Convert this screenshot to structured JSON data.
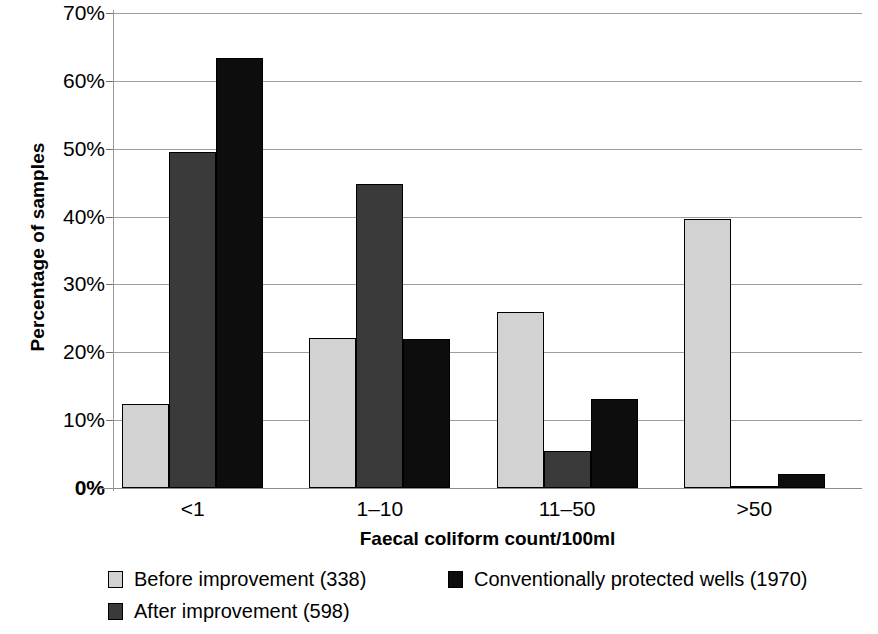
{
  "chart_data": {
    "type": "bar",
    "title": "",
    "xlabel": "Faecal coliform count/100ml",
    "ylabel": "Percentage of samples",
    "categories": [
      "<1",
      "1–10",
      "11–50",
      ">50"
    ],
    "series": [
      {
        "name": "Before improvement (338)",
        "color": "#d2d2d2",
        "values": [
          12.4,
          22.1,
          26.0,
          39.6
        ]
      },
      {
        "name": "After improvement (598)",
        "color": "#3a3a3a",
        "values": [
          49.5,
          44.8,
          5.4,
          0.3
        ]
      },
      {
        "name": "Conventionally protected wells (1970)",
        "color": "#0d0d0d",
        "values": [
          63.3,
          22.0,
          13.1,
          2.0
        ]
      }
    ],
    "ylim": [
      0,
      70
    ],
    "yticks": [
      0,
      10,
      20,
      30,
      40,
      50,
      60,
      70
    ],
    "ytick_labels": [
      "0%",
      "10%",
      "20%",
      "30%",
      "40%",
      "50%",
      "60%",
      "70%"
    ],
    "grid": true,
    "legend_position": "bottom"
  },
  "axes": {
    "y_title": "Percentage of samples",
    "x_title": "Faecal coliform count/100ml"
  },
  "legend": {
    "items": [
      {
        "label": "Before improvement (338)",
        "marker": "legend-swatch-light-gray"
      },
      {
        "label": "After improvement (598)",
        "marker": "legend-swatch-dark-gray"
      },
      {
        "label": "Conventionally protected wells (1970)",
        "marker": "legend-swatch-black"
      }
    ]
  }
}
